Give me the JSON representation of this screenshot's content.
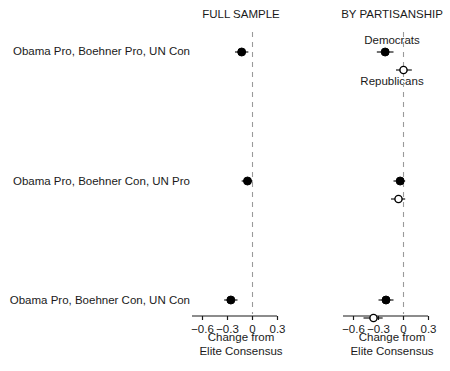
{
  "chart_data": {
    "type": "scatter",
    "title": "",
    "xlabel": "Change from Elite Consensus",
    "ylabel": "",
    "xlim": [
      -0.75,
      0.45
    ],
    "xticks": [
      -0.6,
      -0.3,
      0,
      0.3
    ],
    "xticklabels": [
      "−0.6",
      "−0.3",
      "0",
      "0.3"
    ],
    "grid": false,
    "reference_line": 0,
    "reference_line_style": "dashed",
    "legend_position": "inline-annotations",
    "panels": [
      {
        "name": "full-sample",
        "header": "FULL SAMPLE",
        "axis_label_line1": "Change from",
        "axis_label_line2": "Elite Consensus",
        "series": [
          {
            "name": "Full sample",
            "marker": "filled",
            "points": [
              {
                "category": "Obama Pro, Boehner Pro, UN Con",
                "value": -0.13,
                "ci_low": -0.21,
                "ci_high": -0.05
              },
              {
                "category": "Obama Pro, Boehner Con, UN Pro",
                "value": -0.06,
                "ci_low": -0.13,
                "ci_high": 0.0
              },
              {
                "category": "Obama Pro, Boehner Con, UN Con",
                "value": -0.26,
                "ci_low": -0.34,
                "ci_high": -0.18
              }
            ]
          }
        ]
      },
      {
        "name": "by-partisanship",
        "header": "BY PARTISANSHIP",
        "axis_label_line1": "Change from",
        "axis_label_line2": "Elite Consensus",
        "annotations": [
          {
            "text": "Democrats",
            "row": 0,
            "position": "above"
          },
          {
            "text": "Republicans",
            "row": 0,
            "position": "below"
          }
        ],
        "series": [
          {
            "name": "Democrats",
            "marker": "filled",
            "points": [
              {
                "category": "Obama Pro, Boehner Pro, UN Con",
                "value": -0.22,
                "ci_low": -0.32,
                "ci_high": -0.12
              },
              {
                "category": "Obama Pro, Boehner Con, UN Pro",
                "value": -0.04,
                "ci_low": -0.12,
                "ci_high": 0.02
              },
              {
                "category": "Obama Pro, Boehner Con, UN Con",
                "value": -0.21,
                "ci_low": -0.3,
                "ci_high": -0.12
              }
            ]
          },
          {
            "name": "Republicans",
            "marker": "open",
            "points": [
              {
                "category": "Obama Pro, Boehner Pro, UN Con",
                "value": 0.0,
                "ci_low": -0.09,
                "ci_high": 0.1
              },
              {
                "category": "Obama Pro, Boehner Con, UN Pro",
                "value": -0.06,
                "ci_low": -0.15,
                "ci_high": 0.02
              },
              {
                "category": "Obama Pro, Boehner Con, UN Con",
                "value": -0.36,
                "ci_low": -0.48,
                "ci_high": -0.25
              }
            ]
          }
        ]
      }
    ],
    "categories": [
      "Obama Pro, Boehner Pro, UN Con",
      "Obama Pro, Boehner Con, UN Pro",
      "Obama Pro, Boehner Con, UN Con"
    ]
  },
  "colors": {
    "axis": "#1a1a1a",
    "marker_filled": "#000000",
    "marker_open_fill": "#ffffff",
    "marker_open_stroke": "#000000",
    "reference_line": "#9a9a9a",
    "text": "#1a1a1a"
  }
}
